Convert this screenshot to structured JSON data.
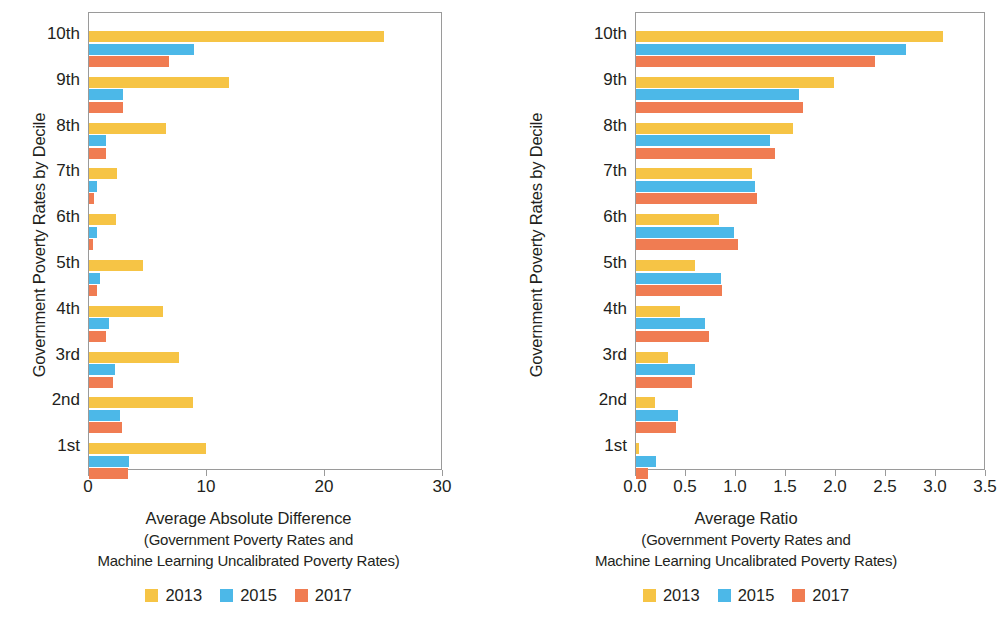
{
  "chart_data": [
    {
      "type": "bar",
      "orientation": "horizontal",
      "panel": "left",
      "title": "",
      "xlabel": "Average Absolute Difference",
      "xlabel_sub1": "(Government Poverty Rates and",
      "xlabel_sub2": "Machine Learning Uncalibrated Poverty Rates)",
      "ylabel": "Government Poverty Rates by Decile",
      "categories": [
        "10th",
        "9th",
        "8th",
        "7th",
        "6th",
        "5th",
        "4th",
        "3rd",
        "2nd",
        "1st"
      ],
      "series": [
        {
          "name": "2013",
          "color": "#f6c445",
          "values": [
            25.0,
            11.9,
            6.5,
            2.4,
            2.3,
            4.6,
            6.3,
            7.6,
            8.8,
            9.9
          ]
        },
        {
          "name": "2015",
          "color": "#4cb8e8",
          "values": [
            8.9,
            2.9,
            1.4,
            0.7,
            0.7,
            0.9,
            1.7,
            2.2,
            2.6,
            3.4
          ]
        },
        {
          "name": "2017",
          "color": "#f07c52",
          "values": [
            6.8,
            2.9,
            1.4,
            0.4,
            0.3,
            0.7,
            1.4,
            2.0,
            2.8,
            3.3
          ]
        }
      ],
      "xticks": [
        "0",
        "10",
        "20",
        "30"
      ],
      "xtick_values": [
        0,
        10,
        20,
        30
      ],
      "xlim": [
        0,
        30
      ],
      "grid": false,
      "legend_position": "bottom"
    },
    {
      "type": "bar",
      "orientation": "horizontal",
      "panel": "right",
      "title": "",
      "xlabel": "Average Ratio",
      "xlabel_sub1": "(Government Poverty Rates and",
      "xlabel_sub2": "Machine Learning Uncalibrated Poverty Rates)",
      "ylabel": "Government Poverty Rates by Decile",
      "categories": [
        "10th",
        "9th",
        "8th",
        "7th",
        "6th",
        "5th",
        "4th",
        "3rd",
        "2nd",
        "1st"
      ],
      "series": [
        {
          "name": "2013",
          "color": "#f6c445",
          "values": [
            3.07,
            1.98,
            1.57,
            1.16,
            0.83,
            0.59,
            0.44,
            0.32,
            0.19,
            0.03
          ]
        },
        {
          "name": "2015",
          "color": "#4cb8e8",
          "values": [
            2.7,
            1.63,
            1.34,
            1.19,
            0.98,
            0.85,
            0.69,
            0.59,
            0.42,
            0.2
          ]
        },
        {
          "name": "2017",
          "color": "#f07c52",
          "values": [
            2.39,
            1.67,
            1.39,
            1.21,
            1.02,
            0.86,
            0.73,
            0.56,
            0.4,
            0.12
          ]
        }
      ],
      "xticks": [
        "0.0",
        "0.5",
        "1.0",
        "1.5",
        "2.0",
        "2.5",
        "3.0",
        "3.5"
      ],
      "xtick_values": [
        0,
        0.5,
        1.0,
        1.5,
        2.0,
        2.5,
        3.0,
        3.5
      ],
      "xlim": [
        0,
        3.5
      ],
      "grid": false,
      "legend_position": "bottom"
    }
  ],
  "legend": {
    "items": [
      {
        "label": "2013",
        "color": "#f6c445"
      },
      {
        "label": "2015",
        "color": "#4cb8e8"
      },
      {
        "label": "2017",
        "color": "#f07c52"
      }
    ]
  },
  "colors": {
    "y2013": "#f6c445",
    "y2015": "#4cb8e8",
    "y2017": "#f07c52",
    "axis": "#9a9a9a",
    "text": "#231f20"
  }
}
